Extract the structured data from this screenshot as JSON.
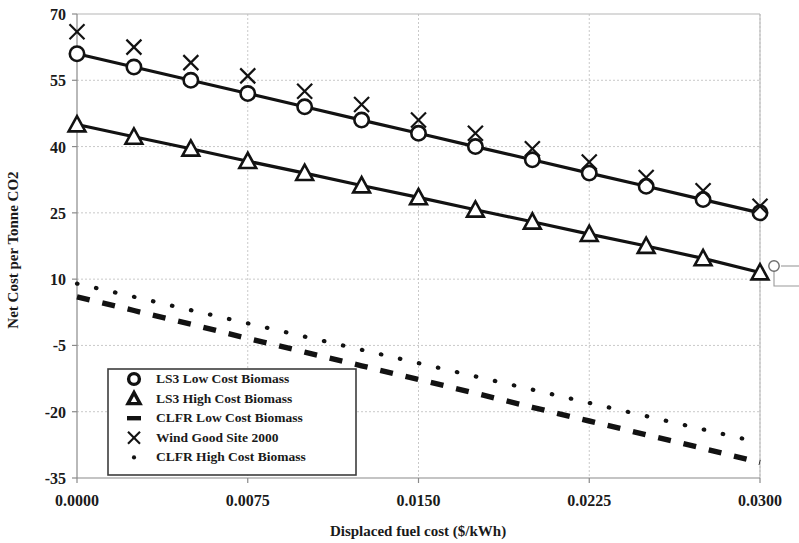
{
  "chart_data": {
    "type": "line",
    "title": "",
    "xlabel": "Displaced fuel cost ($/kWh)",
    "ylabel": "Net Cost per Tonne CO2",
    "xlim": [
      0.0,
      0.03
    ],
    "ylim": [
      -35,
      70
    ],
    "xticks": [
      0.0,
      0.0075,
      0.015,
      0.0225,
      0.03
    ],
    "xtick_labels": [
      "0.0000",
      "0.0075",
      "0.0150",
      "0.0225",
      "0.0300"
    ],
    "yticks": [
      -35,
      -20,
      -5,
      10,
      25,
      40,
      55,
      70
    ],
    "ytick_labels": [
      "-35",
      "-20",
      "-5",
      "10",
      "25",
      "40",
      "55",
      "70"
    ],
    "grid": true,
    "legend_position": "lower-left-inside",
    "x": [
      0.0,
      0.0025,
      0.005,
      0.0075,
      0.01,
      0.0125,
      0.015,
      0.0175,
      0.02,
      0.0225,
      0.025,
      0.0275,
      0.03
    ],
    "series": [
      {
        "name": "LS3 Low Cost Biomass",
        "marker": "circle",
        "line_style": "solid",
        "values": [
          61.0,
          58.0,
          55.0,
          52.0,
          49.0,
          46.0,
          43.0,
          40.0,
          37.0,
          34.0,
          31.0,
          28.0,
          25.0
        ]
      },
      {
        "name": "LS3 High Cost Biomass",
        "marker": "triangle",
        "line_style": "solid",
        "values": [
          45.0,
          42.2,
          39.5,
          36.7,
          34.0,
          31.2,
          28.5,
          25.7,
          23.0,
          20.2,
          17.5,
          14.7,
          11.5
        ]
      },
      {
        "name": "CLFR Low Cost Biomass",
        "marker": "none",
        "line_style": "dashed",
        "values": [
          6.0,
          2.9,
          -0.2,
          -3.4,
          -6.5,
          -9.6,
          -12.7,
          -15.8,
          -19.0,
          -22.1,
          -25.2,
          -28.3,
          -31.5
        ]
      },
      {
        "name": "Wind Good Site 2000",
        "marker": "x",
        "line_style": "none",
        "values": [
          66.0,
          62.5,
          59.0,
          56.0,
          52.5,
          49.5,
          46.0,
          43.0,
          39.5,
          36.5,
          33.0,
          30.0,
          26.5
        ]
      },
      {
        "name": "CLFR High Cost Biomass",
        "marker": "none",
        "line_style": "dotted",
        "values": [
          9.0,
          6.0,
          3.0,
          0.0,
          -3.0,
          -6.0,
          -9.0,
          -12.0,
          -15.0,
          -18.0,
          -21.0,
          -24.0,
          -27.0
        ]
      }
    ]
  },
  "axes": {
    "y_title": "Net Cost per Tonne CO2",
    "x_title": "Displaced fuel cost ($/kWh)"
  },
  "legend": {
    "entries": [
      {
        "label": "LS3 Low Cost Biomass",
        "glyph": "circle-marker-icon"
      },
      {
        "label": "LS3 High Cost Biomass",
        "glyph": "triangle-marker-icon"
      },
      {
        "label": "CLFR Low Cost Biomass",
        "glyph": "dash-marker-icon"
      },
      {
        "label": "Wind Good Site 2000",
        "glyph": "x-marker-icon"
      },
      {
        "label": "CLFR High Cost Biomass",
        "glyph": "dot-marker-icon"
      }
    ]
  }
}
